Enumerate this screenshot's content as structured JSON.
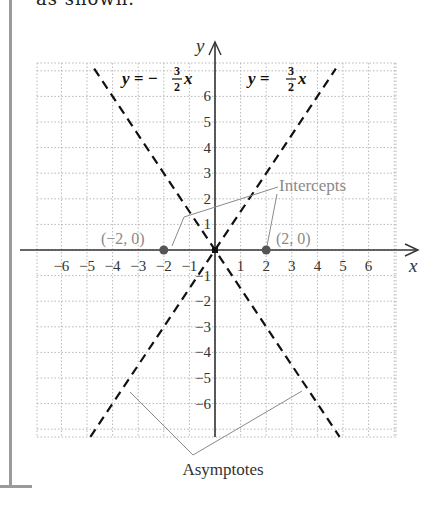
{
  "top_text": "as shown.",
  "axes": {
    "x_label": "x",
    "y_label": "y"
  },
  "x_ticks": [
    "−6",
    "−5",
    "−4",
    "−3",
    "−2",
    "−1",
    "1",
    "2",
    "3",
    "4",
    "5",
    "6"
  ],
  "x_tick_values": [
    -6,
    -5,
    -4,
    -3,
    -2,
    -1,
    1,
    2,
    3,
    4,
    5,
    6
  ],
  "y_ticks": [
    "6",
    "5",
    "4",
    "3",
    "2",
    "1",
    "−1",
    "−2",
    "−3",
    "−4",
    "−5",
    "−6"
  ],
  "y_tick_values": [
    6,
    5,
    4,
    3,
    2,
    1,
    -1,
    -2,
    -3,
    -4,
    -5,
    -6
  ],
  "equations": {
    "left": "y = −(3/2)x",
    "right": "y = (3/2)x",
    "left_parts": {
      "lhs": "y = −",
      "num": "3",
      "den": "2",
      "var": "x"
    },
    "right_parts": {
      "lhs": "y = ",
      "num": "3",
      "den": "2",
      "var": "x"
    }
  },
  "points": [
    {
      "label": "(−2, 0)",
      "x": -2,
      "y": 0
    },
    {
      "label": "(2, 0)",
      "x": 2,
      "y": 0
    }
  ],
  "annotations": {
    "intercepts": "Intercepts",
    "asymptotes": "Asymptotes"
  },
  "colors": {
    "axis": "#333333",
    "asymptote": "#111111",
    "grid": "#b8b8b8",
    "annotation": "#8a8a8a",
    "point": "#555555"
  }
}
